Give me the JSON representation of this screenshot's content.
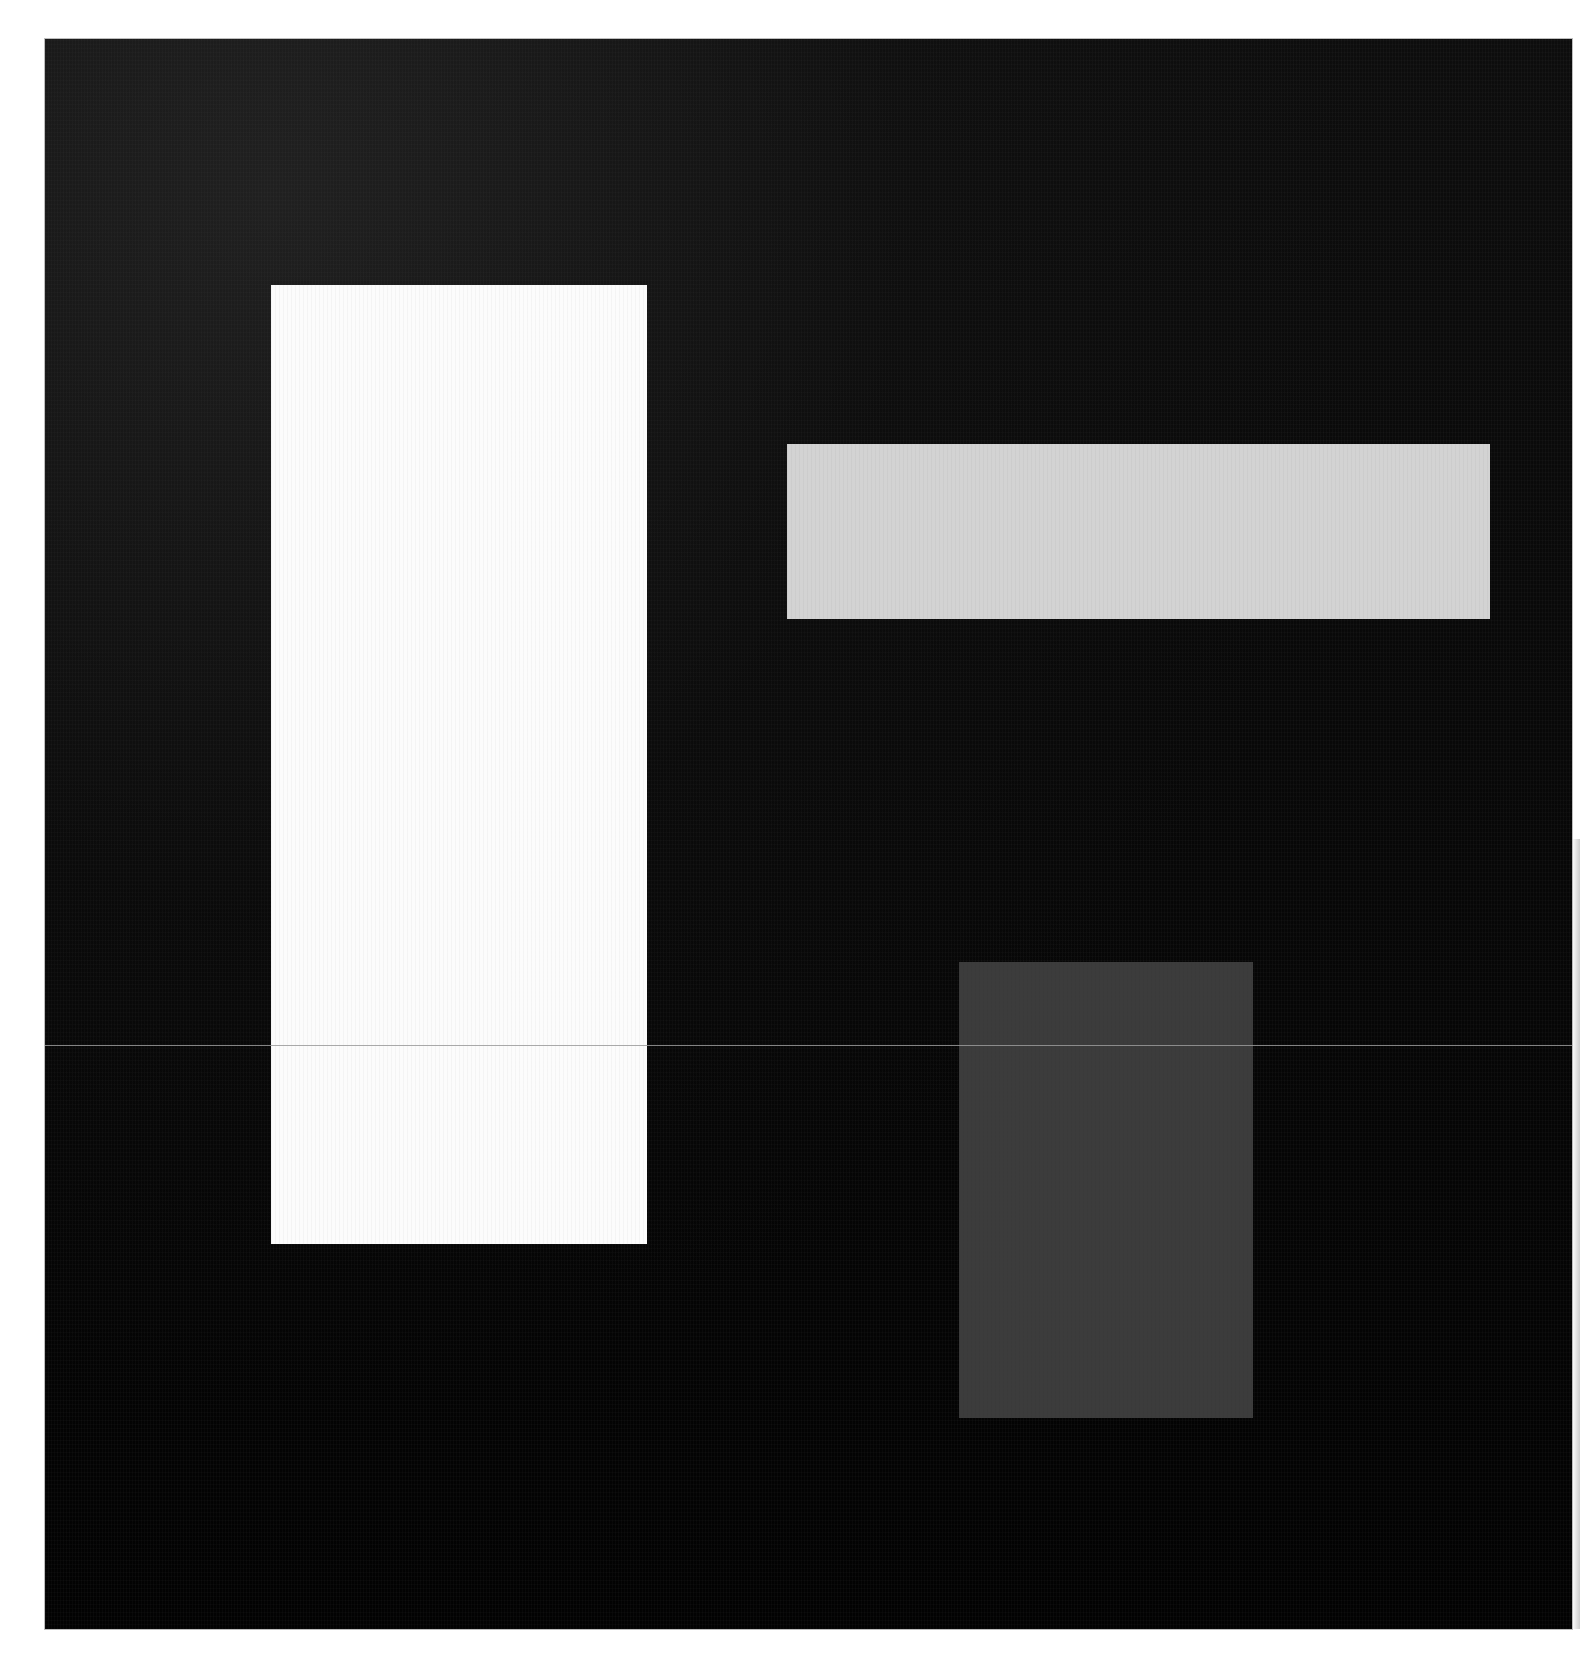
{
  "artwork": {
    "background_color": "#ffffff",
    "canvas": {
      "x": 45,
      "y": 39,
      "width": 1527,
      "height": 1590,
      "color": "#0a0a0a"
    },
    "shapes": [
      {
        "name": "white-vertical-rectangle",
        "x": 271,
        "y": 285,
        "width": 376,
        "height": 959,
        "color": "#fcfcfc"
      },
      {
        "name": "light-gray-horizontal-rectangle",
        "x": 787,
        "y": 444,
        "width": 703,
        "height": 175,
        "color": "#d3d3d3"
      },
      {
        "name": "dark-gray-rectangle",
        "x": 959,
        "y": 962,
        "width": 294,
        "height": 456,
        "color": "#3c3c3c"
      }
    ],
    "scan_line": {
      "x": 45,
      "y": 1045,
      "width": 1527,
      "color": "#9a9a9a"
    }
  }
}
